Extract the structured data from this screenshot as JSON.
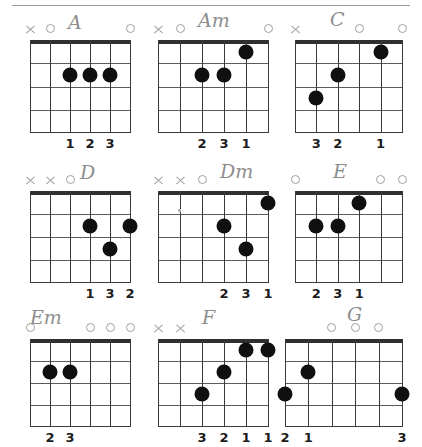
{
  "page": {
    "rule_color": "#9a9a9a",
    "dot_color": "#101010",
    "marker_color": "#a0a0a0",
    "nut_color": "#2f2f2f"
  },
  "legend": {
    "open_symbol": "O",
    "mute_symbol": "X",
    "string_count": 6,
    "fret_count": 4
  },
  "chords": [
    {
      "name": "A",
      "markers": [
        "X",
        "O",
        "",
        "",
        "",
        "O"
      ],
      "dots": [
        {
          "string": 3,
          "fret": 2
        },
        {
          "string": 4,
          "fret": 2
        },
        {
          "string": 5,
          "fret": 2
        }
      ],
      "fingers": [
        {
          "string": 3,
          "label": "1"
        },
        {
          "string": 4,
          "label": "2"
        },
        {
          "string": 5,
          "label": "3"
        }
      ]
    },
    {
      "name": "Am",
      "markers": [
        "X",
        "O",
        "",
        "",
        "",
        "O"
      ],
      "dots": [
        {
          "string": 3,
          "fret": 2
        },
        {
          "string": 4,
          "fret": 2
        },
        {
          "string": 5,
          "fret": 1
        }
      ],
      "fingers": [
        {
          "string": 3,
          "label": "2"
        },
        {
          "string": 4,
          "label": "3"
        },
        {
          "string": 5,
          "label": "1"
        }
      ]
    },
    {
      "name": "C",
      "markers": [
        "X",
        "",
        "",
        "O",
        "",
        "O"
      ],
      "dots": [
        {
          "string": 2,
          "fret": 3
        },
        {
          "string": 3,
          "fret": 2
        },
        {
          "string": 5,
          "fret": 1
        }
      ],
      "fingers": [
        {
          "string": 2,
          "label": "3"
        },
        {
          "string": 3,
          "label": "2"
        },
        {
          "string": 5,
          "label": "1"
        }
      ]
    },
    {
      "name": "D",
      "markers": [
        "X",
        "X",
        "O",
        "",
        "",
        ""
      ],
      "dots": [
        {
          "string": 4,
          "fret": 2
        },
        {
          "string": 5,
          "fret": 3
        },
        {
          "string": 6,
          "fret": 2
        }
      ],
      "fingers": [
        {
          "string": 4,
          "label": "1"
        },
        {
          "string": 5,
          "label": "3"
        },
        {
          "string": 6,
          "label": "2"
        }
      ]
    },
    {
      "name": "Dm",
      "markers": [
        "X",
        "X",
        "O",
        "",
        "",
        ""
      ],
      "dots": [
        {
          "string": 4,
          "fret": 2
        },
        {
          "string": 5,
          "fret": 3
        },
        {
          "string": 6,
          "fret": 1
        }
      ],
      "fingers": [
        {
          "string": 4,
          "label": "2"
        },
        {
          "string": 5,
          "label": "3"
        },
        {
          "string": 6,
          "label": "1"
        }
      ]
    },
    {
      "name": "E",
      "markers": [
        "O",
        "",
        "",
        "",
        "O",
        "O"
      ],
      "dots": [
        {
          "string": 2,
          "fret": 2
        },
        {
          "string": 3,
          "fret": 2
        },
        {
          "string": 4,
          "fret": 1
        }
      ],
      "fingers": [
        {
          "string": 2,
          "label": "2"
        },
        {
          "string": 3,
          "label": "3"
        },
        {
          "string": 4,
          "label": "1"
        }
      ]
    },
    {
      "name": "Em",
      "markers": [
        "O",
        "",
        "",
        "O",
        "O",
        "O"
      ],
      "dots": [
        {
          "string": 2,
          "fret": 2
        },
        {
          "string": 3,
          "fret": 2
        }
      ],
      "fingers": [
        {
          "string": 2,
          "label": "2"
        },
        {
          "string": 3,
          "label": "3"
        }
      ]
    },
    {
      "name": "F",
      "markers": [
        "X",
        "X",
        "",
        "",
        "",
        ""
      ],
      "dots": [
        {
          "string": 3,
          "fret": 3
        },
        {
          "string": 4,
          "fret": 2
        },
        {
          "string": 5,
          "fret": 1
        },
        {
          "string": 6,
          "fret": 1
        }
      ],
      "fingers": [
        {
          "string": 3,
          "label": "3"
        },
        {
          "string": 4,
          "label": "2"
        },
        {
          "string": 5,
          "label": "1"
        },
        {
          "string": 6,
          "label": "1"
        }
      ]
    },
    {
      "name": "G",
      "markers": [
        "",
        "",
        "O",
        "O",
        "O",
        ""
      ],
      "dots": [
        {
          "string": 1,
          "fret": 3
        },
        {
          "string": 2,
          "fret": 2
        },
        {
          "string": 6,
          "fret": 3
        }
      ],
      "fingers": [
        {
          "string": 1,
          "label": "2"
        },
        {
          "string": 2,
          "label": "1"
        },
        {
          "string": 6,
          "label": "3"
        }
      ]
    }
  ],
  "layout": {
    "cells": [
      {
        "board_left": 30,
        "board_top": 32,
        "board_width": 100,
        "board_height": 93,
        "name_left": 68,
        "name_top": 5
      },
      {
        "board_left": 18,
        "board_top": 32,
        "board_width": 110,
        "board_height": 93,
        "name_left": 58,
        "name_top": 3
      },
      {
        "board_left": 10,
        "board_top": 32,
        "board_width": 107,
        "board_height": 93,
        "name_left": 45,
        "name_top": 2
      },
      {
        "board_left": 30,
        "board_top": 34,
        "board_width": 100,
        "board_height": 92,
        "name_left": 80,
        "name_top": 6
      },
      {
        "board_left": 18,
        "board_top": 34,
        "board_width": 110,
        "board_height": 92,
        "name_left": 80,
        "name_top": 5
      },
      {
        "board_left": 10,
        "board_top": 34,
        "board_width": 107,
        "board_height": 92,
        "name_left": 48,
        "name_top": 5
      },
      {
        "board_left": 30,
        "board_top": 34,
        "board_width": 100,
        "board_height": 88,
        "name_left": 30,
        "name_top": 3
      },
      {
        "board_left": 18,
        "board_top": 34,
        "board_width": 110,
        "board_height": 88,
        "name_left": 62,
        "name_top": 3
      },
      {
        "board_left": 0,
        "board_top": 34,
        "board_width": 117,
        "board_height": 88,
        "name_left": 62,
        "name_top": 0
      }
    ]
  }
}
